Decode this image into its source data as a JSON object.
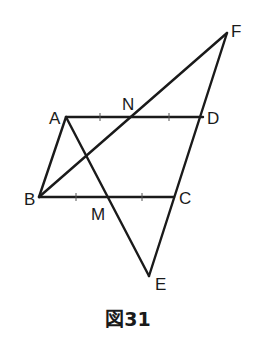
{
  "figure": {
    "caption": "図31",
    "stroke_color": "#1a1a1a",
    "points": {
      "A": {
        "label": "A",
        "x": 66,
        "y": 117
      },
      "D": {
        "label": "D",
        "x": 203,
        "y": 117
      },
      "B": {
        "label": "B",
        "x": 39,
        "y": 197
      },
      "C": {
        "label": "C",
        "x": 174,
        "y": 197
      },
      "N": {
        "label": "N",
        "x": 134,
        "y": 117
      },
      "M": {
        "label": "M",
        "x": 107,
        "y": 197
      },
      "F": {
        "label": "F",
        "x": 227,
        "y": 33
      },
      "E": {
        "label": "E",
        "x": 149,
        "y": 276
      }
    },
    "segments": [
      "AD",
      "BC",
      "AB",
      "CF",
      "AE",
      "BF",
      "CE"
    ],
    "equal_marks": [
      "AN=ND",
      "BM=MC"
    ]
  }
}
